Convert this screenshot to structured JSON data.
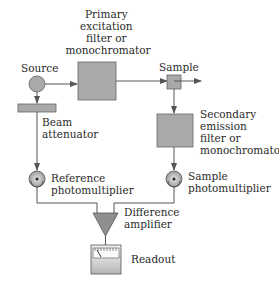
{
  "diagram": {
    "components": {
      "source": {
        "label": "Source"
      },
      "primary_filter": {
        "label_lines": [
          "Primary",
          "excitation",
          "filter or",
          "monochromator"
        ]
      },
      "sample": {
        "label": "Sample"
      },
      "secondary_filter": {
        "label_lines": [
          "Secondary",
          "emission",
          "filter or",
          "monochromator"
        ]
      },
      "beam_attenuator": {
        "label_lines": [
          "Beam",
          "attenuator"
        ]
      },
      "reference_pmt": {
        "label_lines": [
          "Reference",
          "photomultiplier"
        ]
      },
      "sample_pmt": {
        "label_lines": [
          "Sample",
          "photomultiplier"
        ]
      },
      "difference_amplifier": {
        "label_lines": [
          "Difference",
          "amplifier"
        ]
      },
      "readout": {
        "label": "Readout"
      }
    },
    "connections": [
      {
        "from": "source",
        "to": "primary_filter"
      },
      {
        "from": "primary_filter",
        "to": "sample"
      },
      {
        "from": "sample",
        "to": "output"
      },
      {
        "from": "sample",
        "to": "secondary_filter"
      },
      {
        "from": "secondary_filter",
        "to": "sample_pmt"
      },
      {
        "from": "source",
        "to": "beam_attenuator"
      },
      {
        "from": "beam_attenuator",
        "to": "reference_pmt"
      },
      {
        "from": "reference_pmt",
        "to": "difference_amplifier"
      },
      {
        "from": "sample_pmt",
        "to": "difference_amplifier"
      },
      {
        "from": "difference_amplifier",
        "to": "readout"
      }
    ],
    "colors": {
      "fill": "#a9a9a9",
      "line": "#555555",
      "text": "#2a2a2a"
    }
  }
}
